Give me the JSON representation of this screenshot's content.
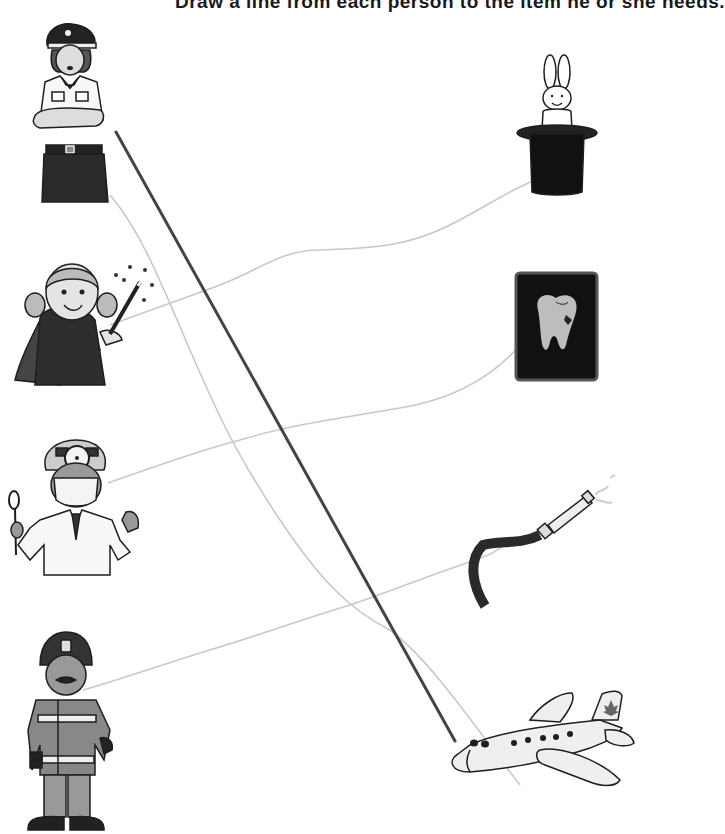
{
  "worksheet": {
    "instruction_text": "Draw a line from each person to the item he or she needs.",
    "colors": {
      "answer_line": "#444444",
      "guide_line": "#c8c8c8",
      "ink": "#1e1e1e",
      "gray_fill": "#8c8c8c",
      "light_fill": "#e6e6e6"
    },
    "people": [
      {
        "id": "pilot",
        "label": "Pilot"
      },
      {
        "id": "magician",
        "label": "Magician"
      },
      {
        "id": "doctor",
        "label": "Doctor"
      },
      {
        "id": "firefighter",
        "label": "Firefighter"
      }
    ],
    "items": [
      {
        "id": "rabbit-in-hat",
        "label": "Rabbit in top hat"
      },
      {
        "id": "tooth-xray",
        "label": "Tooth X-ray"
      },
      {
        "id": "fire-hose",
        "label": "Fire hose"
      },
      {
        "id": "airplane",
        "label": "Airplane"
      }
    ],
    "answer_line": {
      "from": "pilot",
      "to": "airplane"
    }
  }
}
